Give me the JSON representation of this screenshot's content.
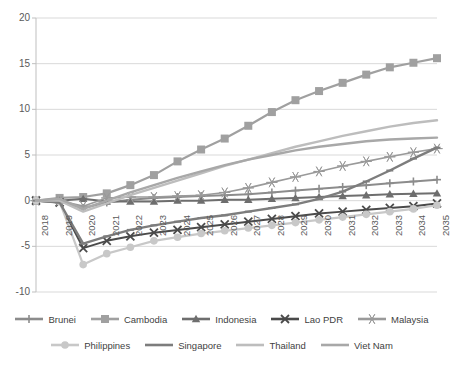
{
  "chart_data": {
    "type": "line",
    "title": "",
    "subtitle": "",
    "xlabel": "",
    "ylabel": "",
    "grid": true,
    "legend_position": "bottom",
    "xlim": [
      2018,
      2035
    ],
    "ylim": [
      -10,
      20
    ],
    "ytick_step": 5,
    "yticks": [
      20,
      15,
      10,
      5,
      0,
      -5,
      -10
    ],
    "categories": [
      2018,
      2019,
      2020,
      2021,
      2022,
      2023,
      2024,
      2025,
      2026,
      2027,
      2028,
      2029,
      2030,
      2031,
      2032,
      2033,
      2034,
      2035
    ],
    "x": [
      "2018",
      "2019",
      "2020",
      "2021",
      "2022",
      "2023",
      "2024",
      "2025",
      "2026",
      "2027",
      "2028",
      "2029",
      "2030",
      "2031",
      "2032",
      "2033",
      "2034",
      "2035"
    ],
    "series": [
      {
        "name": "Brunei",
        "color": "#8c8c8c",
        "marker": "plus",
        "width": 2.0,
        "values": [
          0.0,
          0.0,
          -0.8,
          -0.2,
          0.1,
          0.3,
          0.4,
          0.5,
          0.6,
          0.7,
          0.9,
          1.1,
          1.3,
          1.5,
          1.7,
          1.9,
          2.1,
          2.3
        ]
      },
      {
        "name": "Cambodia",
        "color": "#a0a0a0",
        "marker": "square",
        "width": 2.2,
        "values": [
          0.0,
          0.3,
          0.4,
          0.8,
          1.7,
          2.8,
          4.3,
          5.6,
          6.8,
          8.2,
          9.7,
          11.0,
          12.0,
          12.9,
          13.8,
          14.6,
          15.1,
          15.6
        ]
      },
      {
        "name": "Indonesia",
        "color": "#6e6e6e",
        "marker": "triangle",
        "width": 2.0,
        "values": [
          0.0,
          0.0,
          0.2,
          -0.1,
          -0.1,
          -0.1,
          0.0,
          0.0,
          0.1,
          0.1,
          0.2,
          0.3,
          0.4,
          0.5,
          0.6,
          0.7,
          0.75,
          0.8
        ]
      },
      {
        "name": "Lao PDR",
        "color": "#4a4a4a",
        "marker": "x",
        "width": 2.0,
        "values": [
          0.0,
          -0.2,
          -5.2,
          -4.4,
          -3.9,
          -3.5,
          -3.2,
          -2.9,
          -2.6,
          -2.3,
          -2.0,
          -1.7,
          -1.4,
          -1.2,
          -1.0,
          -0.8,
          -0.6,
          -0.3
        ]
      },
      {
        "name": "Malaysia",
        "color": "#9a9a9a",
        "marker": "asterisk",
        "width": 1.6,
        "values": [
          0.0,
          0.0,
          -0.6,
          0.3,
          0.4,
          0.4,
          0.5,
          0.6,
          0.9,
          1.4,
          2.0,
          2.6,
          3.2,
          3.8,
          4.3,
          4.8,
          5.3,
          5.7
        ]
      },
      {
        "name": "Philippines",
        "color": "#c8c8c8",
        "marker": "circle",
        "width": 2.2,
        "values": [
          0.0,
          -0.1,
          -7.0,
          -5.8,
          -5.1,
          -4.4,
          -4.0,
          -3.6,
          -3.3,
          -3.0,
          -2.7,
          -2.4,
          -2.1,
          -1.8,
          -1.5,
          -1.2,
          -0.9,
          -0.5
        ]
      },
      {
        "name": "Singapore",
        "color": "#7d7d7d",
        "marker": "dash",
        "width": 2.4,
        "values": [
          0.0,
          -0.2,
          -4.7,
          -3.9,
          -3.2,
          -2.7,
          -2.3,
          -1.9,
          -1.6,
          -1.2,
          -0.8,
          -0.4,
          0.2,
          1.0,
          2.1,
          3.3,
          4.6,
          5.8
        ]
      },
      {
        "name": "Thailand",
        "color": "#bdbdbd",
        "marker": "none",
        "width": 2.4,
        "values": [
          0.0,
          0.0,
          -1.2,
          -0.3,
          0.6,
          1.4,
          2.2,
          3.0,
          3.8,
          4.5,
          5.2,
          5.9,
          6.5,
          7.1,
          7.6,
          8.1,
          8.5,
          8.8
        ]
      },
      {
        "name": "Viet Nam",
        "color": "#a8a8a8",
        "marker": "none",
        "width": 2.4,
        "values": [
          0.0,
          0.2,
          -0.9,
          0.0,
          0.9,
          1.7,
          2.5,
          3.2,
          3.9,
          4.5,
          5.0,
          5.5,
          5.9,
          6.2,
          6.5,
          6.7,
          6.8,
          6.9
        ]
      }
    ]
  },
  "axes": {
    "y_labels": [
      "20",
      "15",
      "10",
      "5",
      "0",
      "-5",
      "-10"
    ],
    "x_labels": [
      "2018",
      "2019",
      "2020",
      "2021",
      "2022",
      "2023",
      "2024",
      "2025",
      "2026",
      "2027",
      "2028",
      "2029",
      "2030",
      "2031",
      "2032",
      "2033",
      "2034",
      "2035"
    ]
  },
  "legend": {
    "rows": [
      [
        {
          "label": "Brunei",
          "color": "#8c8c8c",
          "marker": "plus"
        },
        {
          "label": "Cambodia",
          "color": "#a0a0a0",
          "marker": "square"
        },
        {
          "label": "Indonesia",
          "color": "#6e6e6e",
          "marker": "triangle"
        },
        {
          "label": "Lao PDR",
          "color": "#4a4a4a",
          "marker": "x"
        },
        {
          "label": "Malaysia",
          "color": "#9a9a9a",
          "marker": "asterisk"
        }
      ],
      [
        {
          "label": "Philippines",
          "color": "#c8c8c8",
          "marker": "circle"
        },
        {
          "label": "Singapore",
          "color": "#7d7d7d",
          "marker": "dash"
        },
        {
          "label": "Thailand",
          "color": "#bdbdbd",
          "marker": "none"
        },
        {
          "label": "Viet Nam",
          "color": "#a8a8a8",
          "marker": "none"
        }
      ]
    ]
  },
  "colors": {
    "grid": "#d9d9d9",
    "axis": "#bfbfbf",
    "text": "#5a5a5a",
    "background": "#ffffff"
  }
}
